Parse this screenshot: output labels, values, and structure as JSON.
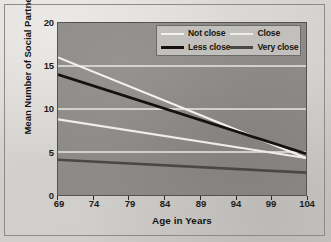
{
  "figure": {
    "background_color": "#d6d4d0",
    "plot_background_color": "#8d8b88",
    "frame_color": "#8d8b87"
  },
  "chart_data": {
    "type": "line",
    "title": "",
    "xlabel": "Age in Years",
    "ylabel": "Mean Number of Social Partners",
    "xlim": [
      69,
      104
    ],
    "ylim": [
      0,
      20
    ],
    "xticks": [
      69,
      74,
      79,
      84,
      89,
      94,
      99,
      104
    ],
    "yticks": [
      0,
      5,
      10,
      15,
      20
    ],
    "grid": "horizontal-white-gridlines",
    "gridlines_y": [
      5,
      10,
      15
    ],
    "legend_position": "upper-right-inside",
    "x": [
      69,
      104
    ],
    "series": [
      {
        "name": "Not close",
        "color": "#f2f1ee",
        "width": 2.2,
        "values": [
          16.0,
          4.3
        ]
      },
      {
        "name": "Close",
        "color": "#eeedea",
        "width": 2.2,
        "values": [
          8.8,
          4.3
        ]
      },
      {
        "name": "Less close",
        "color": "#13120f",
        "width": 2.8,
        "values": [
          14.0,
          4.8
        ]
      },
      {
        "name": "Very close",
        "color": "#4a4845",
        "width": 2.6,
        "values": [
          4.1,
          2.6
        ]
      }
    ]
  },
  "legend": {
    "entries": [
      {
        "label": "Not close",
        "color": "#f2f1ee"
      },
      {
        "label": "Close",
        "color": "#eeedea"
      },
      {
        "label": "Less close",
        "color": "#13120f"
      },
      {
        "label": "Very close",
        "color": "#4a4845"
      }
    ]
  },
  "axes": {
    "y_tick_labels": [
      "20",
      "15",
      "10",
      "5",
      "0"
    ],
    "x_tick_labels": [
      "69",
      "74",
      "79",
      "84",
      "89",
      "94",
      "99",
      "104"
    ],
    "x_axis_title": "Age in Years",
    "y_axis_title": "Mean Number of Social Partners"
  }
}
